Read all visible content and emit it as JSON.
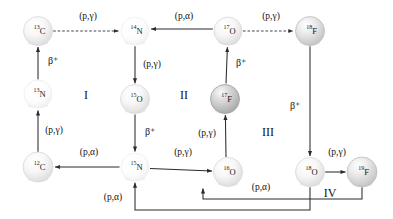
{
  "diagram": {
    "background": "#ffffff",
    "line_color": "#2b2b2b",
    "text_color": "#111111"
  },
  "nodes": [
    {
      "id": "C13",
      "mass": "13",
      "element": "C",
      "x": 38,
      "y": 31,
      "r": 14.5,
      "shade": "light"
    },
    {
      "id": "N14",
      "mass": "14",
      "element": "N",
      "x": 135,
      "y": 31,
      "r": 14.0,
      "shade": "faint"
    },
    {
      "id": "O17",
      "mass": "17",
      "element": "O",
      "x": 228,
      "y": 31,
      "r": 14.0,
      "shade": "light"
    },
    {
      "id": "F18",
      "mass": "18",
      "element": "F",
      "x": 310,
      "y": 31,
      "r": 14.5,
      "shade": "medium"
    },
    {
      "id": "N13",
      "mass": "13",
      "element": "N",
      "x": 38,
      "y": 94,
      "r": 14.0,
      "shade": "faint"
    },
    {
      "id": "O15",
      "mass": "15",
      "element": "O",
      "x": 135,
      "y": 99,
      "r": 14.5,
      "shade": "light"
    },
    {
      "id": "F17",
      "mass": "17",
      "element": "F",
      "x": 225,
      "y": 99,
      "r": 14.5,
      "shade": "dark"
    },
    {
      "id": "C12",
      "mass": "12",
      "element": "C",
      "x": 38,
      "y": 167,
      "r": 15.0,
      "shade": "light"
    },
    {
      "id": "N15",
      "mass": "15",
      "element": "N",
      "x": 135,
      "y": 167,
      "r": 14.0,
      "shade": "faint"
    },
    {
      "id": "O16",
      "mass": "16",
      "element": "O",
      "x": 228,
      "y": 172,
      "r": 14.5,
      "shade": "light"
    },
    {
      "id": "O18",
      "mass": "18",
      "element": "O",
      "x": 310,
      "y": 172,
      "r": 14.5,
      "shade": "light"
    },
    {
      "id": "F19",
      "mass": "19",
      "element": "F",
      "x": 362,
      "y": 172,
      "r": 15.0,
      "shade": "medium"
    }
  ],
  "reactions": [
    {
      "id": "r1",
      "from": "C12",
      "to": "N13",
      "label": "(p,γ)",
      "kind": "capture",
      "label_x": 54,
      "label_y": 131
    },
    {
      "id": "r2",
      "from": "N13",
      "to": "C13",
      "label": "β⁺",
      "kind": "beta",
      "label_x": 53,
      "label_y": 62
    },
    {
      "id": "r3",
      "from": "C13",
      "to": "N14",
      "label": "(p,γ)",
      "kind": "capture",
      "label_x": 88,
      "label_y": 17
    },
    {
      "id": "r4",
      "from": "N14",
      "to": "O15",
      "label": "(p,γ)",
      "kind": "capture",
      "label_x": 152,
      "label_y": 65
    },
    {
      "id": "r5",
      "from": "O15",
      "to": "N15",
      "label": "β⁺",
      "kind": "beta",
      "label_x": 150,
      "label_y": 133
    },
    {
      "id": "r6",
      "from": "N15",
      "to": "C12",
      "label": "(p,α)",
      "kind": "alpha",
      "label_x": 89,
      "label_y": 153
    },
    {
      "id": "r7",
      "from": "N15",
      "to": "O16",
      "label": "(p,γ)",
      "kind": "capture",
      "label_x": 183,
      "label_y": 153
    },
    {
      "id": "r8",
      "from": "O16",
      "to": "F17",
      "label": "(p,γ)",
      "kind": "capture",
      "label_x": 207,
      "label_y": 134
    },
    {
      "id": "r9",
      "from": "F17",
      "to": "O17",
      "label": "β⁺",
      "kind": "beta",
      "label_x": 241,
      "label_y": 64
    },
    {
      "id": "r10",
      "from": "O17",
      "to": "N14",
      "label": "(p,α)",
      "kind": "alpha",
      "label_x": 184,
      "label_y": 17
    },
    {
      "id": "r11",
      "from": "O17",
      "to": "F18",
      "label": "(p,γ)",
      "kind": "capture",
      "label_x": 271,
      "label_y": 17
    },
    {
      "id": "r12",
      "from": "F18",
      "to": "O18",
      "label": "β⁺",
      "kind": "beta",
      "label_x": 295,
      "label_y": 107
    },
    {
      "id": "r13",
      "from": "O18",
      "to": "F19",
      "label": "(p,γ)",
      "kind": "capture",
      "label_x": 337,
      "label_y": 153
    },
    {
      "id": "r14",
      "from": "F19",
      "to": "O16",
      "label": "(p,α)",
      "kind": "alpha",
      "label_x": 261,
      "label_y": 188
    },
    {
      "id": "r15",
      "from": "O18",
      "to": "N15",
      "label": "(p,α)",
      "kind": "alpha",
      "label_x": 113,
      "label_y": 198
    }
  ],
  "cycles": [
    {
      "id": "cycle-1",
      "label": "I",
      "x": 86,
      "y": 96
    },
    {
      "id": "cycle-2",
      "label": "II",
      "x": 184,
      "y": 96
    },
    {
      "id": "cycle-3",
      "label": "III",
      "x": 268,
      "y": 133
    },
    {
      "id": "cycle-4",
      "label": "IV",
      "x": 330,
      "y": 194
    }
  ]
}
